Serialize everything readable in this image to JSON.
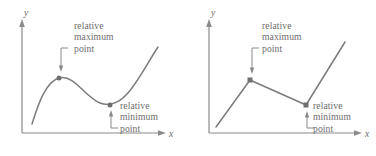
{
  "figure": {
    "panels": [
      {
        "id": "left",
        "curve_kind": "smooth-cubic",
        "axis": {
          "y_label": "y",
          "x_label": "x",
          "y_axis_x": 22,
          "x_axis_y": 133,
          "x_axis_end": 166,
          "y_axis_top": 22
        },
        "max_annotation": {
          "line1": "relative",
          "line2": "maximum",
          "line3": "point",
          "text_x": 74,
          "text_y": 20
        },
        "min_annotation": {
          "line1": "relative",
          "line2": "minimum",
          "line3": "point",
          "text_x": 120,
          "text_y": 100
        },
        "max_point": {
          "x": 59,
          "y": 78
        },
        "min_point": {
          "x": 110,
          "y": 105
        },
        "curve_path": "M 32 124 C 36 112 44 82 59 78 C 74 74 84 96 100 103 C 108 106 118 104 127 94 C 138 82 148 62 158 47",
        "curve_start": {
          "x": 32,
          "y": 124
        },
        "curve_end": {
          "x": 158,
          "y": 47
        }
      },
      {
        "id": "right",
        "curve_kind": "piecewise-linear",
        "axis": {
          "y_label": "y",
          "x_label": "x",
          "y_axis_x": 21,
          "x_axis_y": 133,
          "x_axis_end": 174,
          "y_axis_top": 22
        },
        "max_annotation": {
          "line1": "relative",
          "line2": "maximum",
          "line3": "point",
          "text_x": 74,
          "text_y": 20
        },
        "min_annotation": {
          "line1": "relative",
          "line2": "minimum",
          "line3": "point",
          "text_x": 125,
          "text_y": 100
        },
        "max_point": {
          "x": 62,
          "y": 80
        },
        "min_point": {
          "x": 118,
          "y": 105
        },
        "segments": [
          {
            "x1": 28,
            "y1": 127,
            "x2": 62,
            "y2": 80
          },
          {
            "x1": 62,
            "y1": 80,
            "x2": 118,
            "y2": 105
          },
          {
            "x1": 118,
            "y1": 105,
            "x2": 157,
            "y2": 42
          }
        ]
      }
    ],
    "colors": {
      "curve": "#7b7b7b",
      "axis": "#8a8a8a",
      "text": "#6d6d6d",
      "dot": "#6f6f6f",
      "background": "#ffffff"
    }
  }
}
